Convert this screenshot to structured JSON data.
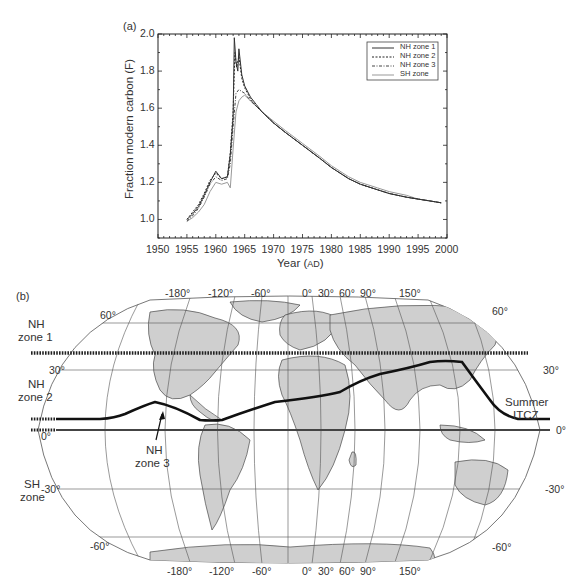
{
  "chart_data": [
    {
      "panel": "(a)",
      "type": "line",
      "title": "",
      "xlabel": "Year (AD)",
      "ylabel": "Fraction modern carbon (F)",
      "xlim": [
        1950,
        2000
      ],
      "ylim": [
        0.9,
        2.0
      ],
      "xticks": [
        "1950",
        "1955",
        "1960",
        "1965",
        "1970",
        "1975",
        "1980",
        "1985",
        "1990",
        "1995",
        "2000"
      ],
      "yticks": [
        "1.0",
        "1.2",
        "1.4",
        "1.6",
        "1.8",
        "2.0"
      ],
      "grid": false,
      "legend_position": "top-right",
      "series": [
        {
          "name": "NH zone 1",
          "style": "solid",
          "color": "#333333",
          "x": [
            1955,
            1956,
            1957,
            1958,
            1959,
            1960,
            1961,
            1962,
            1962.5,
            1963,
            1963.2,
            1963.5,
            1963.8,
            1964,
            1964.5,
            1965,
            1966,
            1967,
            1968,
            1970,
            1972,
            1975,
            1978,
            1980,
            1983,
            1985,
            1988,
            1990,
            1993,
            1995,
            1997,
            1999
          ],
          "y": [
            1.0,
            1.03,
            1.07,
            1.13,
            1.2,
            1.26,
            1.22,
            1.23,
            1.35,
            1.55,
            1.98,
            1.85,
            1.8,
            1.92,
            1.78,
            1.72,
            1.66,
            1.62,
            1.58,
            1.52,
            1.47,
            1.4,
            1.33,
            1.28,
            1.22,
            1.19,
            1.16,
            1.14,
            1.12,
            1.11,
            1.1,
            1.09
          ]
        },
        {
          "name": "NH zone 2",
          "style": "dashed",
          "color": "#222222",
          "x": [
            1955,
            1956,
            1957,
            1958,
            1959,
            1960,
            1961,
            1962,
            1962.5,
            1963,
            1963.3,
            1963.6,
            1964,
            1964.5,
            1965,
            1966,
            1967,
            1968,
            1970,
            1972,
            1975,
            1978,
            1980,
            1983,
            1985,
            1988,
            1990,
            1993,
            1995,
            1997,
            1999
          ],
          "y": [
            1.0,
            1.04,
            1.08,
            1.14,
            1.21,
            1.25,
            1.22,
            1.23,
            1.36,
            1.58,
            1.9,
            1.82,
            1.88,
            1.76,
            1.71,
            1.65,
            1.61,
            1.58,
            1.52,
            1.47,
            1.4,
            1.33,
            1.28,
            1.22,
            1.19,
            1.16,
            1.14,
            1.12,
            1.11,
            1.1,
            1.09
          ]
        },
        {
          "name": "NH zone 3",
          "style": "dash-dot",
          "color": "#444444",
          "x": [
            1955,
            1956,
            1957,
            1958,
            1959,
            1960,
            1961,
            1962,
            1962.5,
            1963,
            1963.5,
            1964,
            1964.5,
            1965,
            1966,
            1967,
            1968,
            1970,
            1972,
            1975,
            1978,
            1980,
            1983,
            1985,
            1988,
            1990,
            1993,
            1995,
            1997,
            1999
          ],
          "y": [
            0.99,
            1.02,
            1.06,
            1.12,
            1.19,
            1.23,
            1.21,
            1.22,
            1.3,
            1.5,
            1.68,
            1.7,
            1.69,
            1.68,
            1.64,
            1.61,
            1.58,
            1.52,
            1.47,
            1.4,
            1.33,
            1.28,
            1.22,
            1.19,
            1.16,
            1.14,
            1.12,
            1.11,
            1.1,
            1.09
          ]
        },
        {
          "name": "SH zone",
          "style": "solid",
          "color": "#999999",
          "x": [
            1955,
            1956,
            1957,
            1958,
            1959,
            1960,
            1961,
            1962,
            1962.5,
            1963,
            1963.5,
            1964,
            1964.5,
            1965,
            1966,
            1967,
            1968,
            1970,
            1972,
            1975,
            1978,
            1980,
            1983,
            1985,
            1988,
            1990,
            1993,
            1995,
            1997,
            1999
          ],
          "y": [
            0.99,
            1.01,
            1.04,
            1.08,
            1.15,
            1.2,
            1.19,
            1.2,
            1.17,
            1.38,
            1.58,
            1.64,
            1.66,
            1.67,
            1.64,
            1.61,
            1.58,
            1.53,
            1.48,
            1.41,
            1.34,
            1.29,
            1.23,
            1.2,
            1.17,
            1.15,
            1.13,
            1.11,
            1.1,
            1.09
          ]
        }
      ]
    },
    {
      "panel": "(b)",
      "type": "map",
      "title": "",
      "projection": "Robinson-like world map",
      "longitude_labels_top": [
        "-180°",
        "-120°",
        "-60°",
        "0°",
        "30°",
        "60°",
        "90°",
        "150°"
      ],
      "longitude_labels_bottom": [
        "-180°",
        "-120°",
        "-60°",
        "0°",
        "30°",
        "60°",
        "90°",
        "150°"
      ],
      "latitude_labels_left": [
        "60°",
        "30°",
        "0°",
        "-30°",
        "-60°"
      ],
      "latitude_labels_right": [
        "60°",
        "30°",
        "0°",
        "-30°",
        "-60°"
      ],
      "zone_labels": [
        "NH zone 1",
        "NH zone 2",
        "NH zone 3",
        "SH zone"
      ],
      "annotations": [
        "Summer ITCZ"
      ],
      "boundaries": [
        {
          "name": "NH zone 1 / NH zone 2 boundary",
          "latitude": 40,
          "style": "dotted"
        },
        {
          "name": "Summer ITCZ",
          "style": "thick solid curve"
        },
        {
          "name": "Equator",
          "latitude": 0,
          "style": "thick solid"
        }
      ]
    }
  ],
  "panel_a": {
    "label": "(a)",
    "ylabel": "Fraction modern carbon (F)",
    "xlabel_main": "Year (",
    "xlabel_unit": "AD",
    "xlabel_close": ")",
    "yticks": [
      "2.0",
      "1.8",
      "1.6",
      "1.4",
      "1.2",
      "1.0"
    ],
    "xticks": [
      "1950",
      "1955",
      "1960",
      "1965",
      "1970",
      "1975",
      "1980",
      "1985",
      "1990",
      "1995",
      "2000"
    ],
    "legend": [
      "NH zone 1",
      "NH zone 2",
      "NH zone 3",
      "SH zone"
    ]
  },
  "panel_b": {
    "label": "(b)",
    "top_lon": [
      "-180°",
      "-120°",
      "-60°",
      "0°",
      "30°",
      "60°",
      "90°",
      "150°"
    ],
    "bottom_lon": [
      "-180°",
      "-120°",
      "-60°",
      "0°",
      "30°",
      "60°",
      "90°",
      "150°"
    ],
    "left_lat": {
      "lat60": "60°",
      "lat30": "30°",
      "lat0": "0°",
      "latm30": "-30°",
      "latm60": "-60°"
    },
    "right_lat": {
      "lat60": "60°",
      "lat30": "30°",
      "lat0": "0°",
      "latm30": "-30°",
      "latm60": "-60°"
    },
    "zones": {
      "nh1_a": "NH",
      "nh1_b": "zone 1",
      "nh2_a": "NH",
      "nh2_b": "zone 2",
      "nh3_a": "NH",
      "nh3_b": "zone 3",
      "sh_a": "SH",
      "sh_b": "zone"
    },
    "itcz_a": "Summer",
    "itcz_b": "ITCZ"
  }
}
